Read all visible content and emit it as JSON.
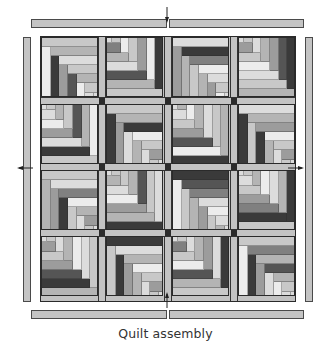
{
  "caption": "Quilt assembly",
  "colors": {
    "border_strip": "#c4c4c4",
    "outline": "#3a3a3a",
    "sashing": "#c3c3c3",
    "cornerstone": "#2b2b2b",
    "palette": [
      "#ececec",
      "#dcdcdc",
      "#c8c8c8",
      "#b4b4b4",
      "#9c9c9c",
      "#808080",
      "#555555",
      "#3a3a3a"
    ]
  },
  "borders": {
    "top": [
      {
        "x": 31,
        "y": 19,
        "w": 136,
        "h": 9
      },
      {
        "x": 169,
        "y": 19,
        "w": 135,
        "h": 9
      }
    ],
    "bottom": [
      {
        "x": 31,
        "y": 310,
        "w": 136,
        "h": 9
      },
      {
        "x": 169,
        "y": 310,
        "w": 135,
        "h": 9
      }
    ],
    "left": {
      "x": 23,
      "y": 37,
      "w": 8,
      "h": 265
    },
    "right": {
      "x": 305,
      "y": 37,
      "w": 8,
      "h": 265
    }
  },
  "arrows": [
    {
      "name": "arrow-top",
      "dir": "down",
      "x": 167,
      "y": 15
    },
    {
      "name": "arrow-bottom",
      "dir": "up",
      "x": 167,
      "y": 300
    },
    {
      "name": "arrow-left",
      "dir": "left",
      "x": 25,
      "y": 168
    },
    {
      "name": "arrow-right",
      "dir": "right",
      "x": 296,
      "y": 168
    }
  ],
  "grid": {
    "cols_x": [
      41,
      106,
      172,
      238
    ],
    "rows_y": [
      37,
      104,
      170,
      236
    ],
    "block_w": 57,
    "block_h": 60,
    "sash_v_x": [
      98,
      164,
      230
    ],
    "sash_h_y": [
      97,
      163,
      229
    ],
    "sash_w": 8
  },
  "blocks": [
    {
      "row": 0,
      "col": 0,
      "corner": "BR",
      "shades": [
        2,
        0,
        3,
        7,
        1,
        4,
        2,
        6,
        3,
        0,
        2,
        1
      ]
    },
    {
      "row": 0,
      "col": 1,
      "corner": "TL",
      "shades": [
        2,
        7,
        3,
        0,
        6,
        4,
        1,
        2,
        3,
        0,
        5,
        2
      ]
    },
    {
      "row": 0,
      "col": 2,
      "corner": "BR",
      "shades": [
        1,
        4,
        7,
        3,
        5,
        2,
        0,
        3,
        1,
        4,
        2,
        0
      ]
    },
    {
      "row": 0,
      "col": 3,
      "corner": "TL",
      "shades": [
        3,
        7,
        2,
        6,
        1,
        4,
        0,
        3,
        2,
        1,
        4,
        2
      ]
    },
    {
      "row": 1,
      "col": 0,
      "corner": "TL",
      "shades": [
        2,
        0,
        7,
        3,
        1,
        6,
        4,
        2,
        0,
        3,
        1,
        2
      ]
    },
    {
      "row": 1,
      "col": 1,
      "corner": "BR",
      "shades": [
        2,
        7,
        3,
        4,
        7,
        1,
        0,
        3,
        2,
        1,
        4,
        2
      ]
    },
    {
      "row": 1,
      "col": 2,
      "corner": "TL",
      "shades": [
        7,
        3,
        0,
        2,
        6,
        1,
        4,
        3,
        2,
        0,
        1,
        3
      ]
    },
    {
      "row": 1,
      "col": 3,
      "corner": "BR",
      "shades": [
        1,
        7,
        3,
        2,
        4,
        7,
        0,
        3,
        2,
        1,
        4,
        2
      ]
    },
    {
      "row": 2,
      "col": 0,
      "corner": "BR",
      "shades": [
        2,
        3,
        1,
        4,
        5,
        7,
        0,
        2,
        3,
        1,
        4,
        2
      ]
    },
    {
      "row": 2,
      "col": 1,
      "corner": "TL",
      "shades": [
        7,
        1,
        3,
        2,
        4,
        6,
        0,
        3,
        1,
        2,
        3,
        2
      ]
    },
    {
      "row": 2,
      "col": 2,
      "corner": "BR",
      "shades": [
        7,
        0,
        6,
        2,
        5,
        3,
        1,
        4,
        0,
        2,
        1,
        3
      ]
    },
    {
      "row": 2,
      "col": 3,
      "corner": "TL",
      "shades": [
        2,
        7,
        7,
        3,
        5,
        1,
        4,
        0,
        2,
        3,
        1,
        2
      ]
    },
    {
      "row": 3,
      "col": 0,
      "corner": "TL",
      "shades": [
        3,
        2,
        7,
        1,
        6,
        0,
        4,
        3,
        2,
        1,
        4,
        2
      ]
    },
    {
      "row": 3,
      "col": 1,
      "corner": "BR",
      "shades": [
        7,
        2,
        1,
        7,
        3,
        4,
        0,
        3,
        2,
        1,
        4,
        2
      ]
    },
    {
      "row": 3,
      "col": 2,
      "corner": "TL",
      "shades": [
        2,
        7,
        3,
        1,
        6,
        4,
        0,
        3,
        2,
        1,
        5,
        2
      ]
    },
    {
      "row": 3,
      "col": 3,
      "corner": "BR",
      "shades": [
        2,
        0,
        5,
        7,
        3,
        4,
        6,
        1,
        3,
        0,
        2,
        1
      ]
    }
  ]
}
